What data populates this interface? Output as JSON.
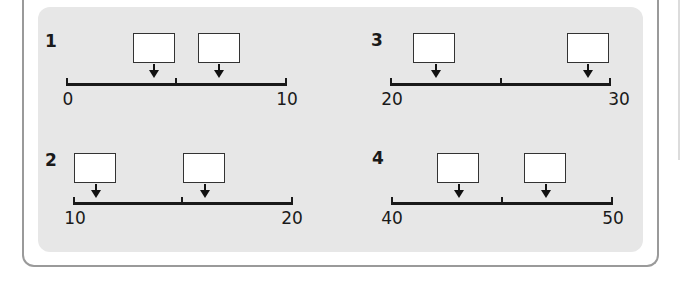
{
  "problems": [
    {
      "number": "1",
      "start_label": "0",
      "end_label": "10",
      "boxes": [
        "",
        ""
      ],
      "arrow_positions": [
        4,
        7
      ]
    },
    {
      "number": "2",
      "start_label": "10",
      "end_label": "20",
      "boxes": [
        "",
        ""
      ],
      "arrow_positions": [
        11,
        16
      ]
    },
    {
      "number": "3",
      "start_label": "20",
      "end_label": "30",
      "boxes": [
        "",
        ""
      ],
      "arrow_positions": [
        22,
        29
      ]
    },
    {
      "number": "4",
      "start_label": "40",
      "end_label": "50",
      "boxes": [
        "",
        ""
      ],
      "arrow_positions": [
        43,
        47
      ]
    }
  ],
  "colors": {
    "panel": "#e7e7e7",
    "frame": "#9a9a9a",
    "line": "#1a1a1a",
    "box": "#ffffff"
  }
}
